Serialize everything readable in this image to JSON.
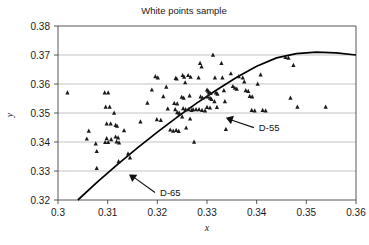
{
  "chart_data": {
    "type": "scatter",
    "title": "White points sample",
    "xlabel": "x",
    "ylabel": "y",
    "xlim": [
      0.3,
      0.36
    ],
    "ylim": [
      0.32,
      0.38
    ],
    "xticks": [
      "0.3",
      "0.31",
      "0.32",
      "0.33",
      "0.34",
      "0.35",
      "0.36"
    ],
    "xtick_values": [
      0.3,
      0.31,
      0.32,
      0.33,
      0.34,
      0.35,
      0.36
    ],
    "yticks": [
      "0.32",
      "0.33",
      "0.34",
      "0.35",
      "0.36",
      "0.37",
      "0.38"
    ],
    "ytick_values": [
      0.32,
      0.33,
      0.34,
      0.35,
      0.36,
      0.37,
      0.38
    ],
    "grid": "horizontal",
    "legend": "none",
    "marker": "triangle",
    "marker_color": "#1a1a1a",
    "line_color": "#000000",
    "grid_color": "#aaaaaa",
    "axis_color": "#444444",
    "series": [
      {
        "name": "White points sample",
        "type": "scatter",
        "points": [
          [
            0.3019,
            0.357
          ],
          [
            0.3062,
            0.3438
          ],
          [
            0.3058,
            0.3411
          ],
          [
            0.3076,
            0.3394
          ],
          [
            0.3078,
            0.3368
          ],
          [
            0.3078,
            0.331
          ],
          [
            0.3094,
            0.357
          ],
          [
            0.3101,
            0.357
          ],
          [
            0.3096,
            0.3521
          ],
          [
            0.3104,
            0.3521
          ],
          [
            0.3098,
            0.3463
          ],
          [
            0.3106,
            0.3463
          ],
          [
            0.3095,
            0.3399
          ],
          [
            0.3101,
            0.3399
          ],
          [
            0.3098,
            0.3412
          ],
          [
            0.3107,
            0.3409
          ],
          [
            0.3113,
            0.35
          ],
          [
            0.3116,
            0.3458
          ],
          [
            0.3119,
            0.3455
          ],
          [
            0.3116,
            0.3418
          ],
          [
            0.3121,
            0.3415
          ],
          [
            0.3118,
            0.3401
          ],
          [
            0.3123,
            0.3398
          ],
          [
            0.3122,
            0.3333
          ],
          [
            0.3133,
            0.344
          ],
          [
            0.3141,
            0.336
          ],
          [
            0.3145,
            0.3346
          ],
          [
            0.3166,
            0.347
          ],
          [
            0.318,
            0.3535
          ],
          [
            0.3189,
            0.358
          ],
          [
            0.3196,
            0.3626
          ],
          [
            0.3201,
            0.3622
          ],
          [
            0.3199,
            0.3478
          ],
          [
            0.3207,
            0.3475
          ],
          [
            0.3212,
            0.3557
          ],
          [
            0.3218,
            0.359
          ],
          [
            0.3221,
            0.3515
          ],
          [
            0.3226,
            0.3442
          ],
          [
            0.3232,
            0.3438
          ],
          [
            0.3237,
            0.362
          ],
          [
            0.3239,
            0.3618
          ],
          [
            0.3234,
            0.3534
          ],
          [
            0.324,
            0.3532
          ],
          [
            0.3236,
            0.3512
          ],
          [
            0.324,
            0.3502
          ],
          [
            0.3244,
            0.35
          ],
          [
            0.3238,
            0.3441
          ],
          [
            0.3243,
            0.3437
          ],
          [
            0.3251,
            0.363
          ],
          [
            0.3254,
            0.3624
          ],
          [
            0.3256,
            0.3605
          ],
          [
            0.3249,
            0.3555
          ],
          [
            0.3253,
            0.3552
          ],
          [
            0.3252,
            0.3516
          ],
          [
            0.3257,
            0.3512
          ],
          [
            0.325,
            0.3487
          ],
          [
            0.3258,
            0.3449
          ],
          [
            0.3262,
            0.363
          ],
          [
            0.3267,
            0.3624
          ],
          [
            0.3265,
            0.356
          ],
          [
            0.3263,
            0.3512
          ],
          [
            0.3269,
            0.351
          ],
          [
            0.3272,
            0.3512
          ],
          [
            0.3278,
            0.3512
          ],
          [
            0.3266,
            0.348
          ],
          [
            0.3274,
            0.34
          ],
          [
            0.3286,
            0.3672
          ],
          [
            0.3289,
            0.366
          ],
          [
            0.3283,
            0.3622
          ],
          [
            0.3287,
            0.3556
          ],
          [
            0.3291,
            0.3552
          ],
          [
            0.3284,
            0.3512
          ],
          [
            0.329,
            0.351
          ],
          [
            0.3296,
            0.3508
          ],
          [
            0.33,
            0.358
          ],
          [
            0.3302,
            0.3576
          ],
          [
            0.3304,
            0.3571
          ],
          [
            0.3307,
            0.3568
          ],
          [
            0.3301,
            0.3556
          ],
          [
            0.3306,
            0.3552
          ],
          [
            0.3309,
            0.3548
          ],
          [
            0.33,
            0.352
          ],
          [
            0.3306,
            0.3518
          ],
          [
            0.3312,
            0.37
          ],
          [
            0.3316,
            0.3622
          ],
          [
            0.3318,
            0.357
          ],
          [
            0.3321,
            0.3566
          ],
          [
            0.3315,
            0.354
          ],
          [
            0.332,
            0.352
          ],
          [
            0.3329,
            0.3672
          ],
          [
            0.3331,
            0.3622
          ],
          [
            0.3334,
            0.3578
          ],
          [
            0.3336,
            0.354
          ],
          [
            0.3338,
            0.3444
          ],
          [
            0.3348,
            0.3636
          ],
          [
            0.3352,
            0.3592
          ],
          [
            0.3356,
            0.3586
          ],
          [
            0.336,
            0.3583
          ],
          [
            0.3364,
            0.3626
          ],
          [
            0.3372,
            0.3622
          ],
          [
            0.3375,
            0.3608
          ],
          [
            0.3378,
            0.3578
          ],
          [
            0.3383,
            0.3575
          ],
          [
            0.3386,
            0.3558
          ],
          [
            0.3391,
            0.3556
          ],
          [
            0.339,
            0.351
          ],
          [
            0.3396,
            0.3508
          ],
          [
            0.3402,
            0.36
          ],
          [
            0.3408,
            0.3632
          ],
          [
            0.3412,
            0.351
          ],
          [
            0.3418,
            0.3508
          ],
          [
            0.3458,
            0.3692
          ],
          [
            0.3464,
            0.369
          ],
          [
            0.3468,
            0.3552
          ],
          [
            0.3474,
            0.3665
          ],
          [
            0.3482,
            0.3521
          ],
          [
            0.3539,
            0.3521
          ]
        ]
      }
    ],
    "annotations": [
      {
        "label": "D-55",
        "target_x": 0.3338,
        "target_y": 0.3484
      },
      {
        "label": "D-65",
        "target_x": 0.3143,
        "target_y": 0.3288
      }
    ],
    "curve": {
      "name": "daylight-locus",
      "points": [
        [
          0.304,
          0.32
        ],
        [
          0.308,
          0.3263
        ],
        [
          0.312,
          0.3323
        ],
        [
          0.316,
          0.338
        ],
        [
          0.32,
          0.3434
        ],
        [
          0.324,
          0.3486
        ],
        [
          0.328,
          0.3535
        ],
        [
          0.332,
          0.358
        ],
        [
          0.336,
          0.3623
        ],
        [
          0.34,
          0.3661
        ],
        [
          0.344,
          0.369
        ],
        [
          0.348,
          0.3705
        ],
        [
          0.352,
          0.371
        ],
        [
          0.356,
          0.3707
        ],
        [
          0.36,
          0.37
        ]
      ]
    }
  },
  "caption": {
    "fragment": ""
  }
}
